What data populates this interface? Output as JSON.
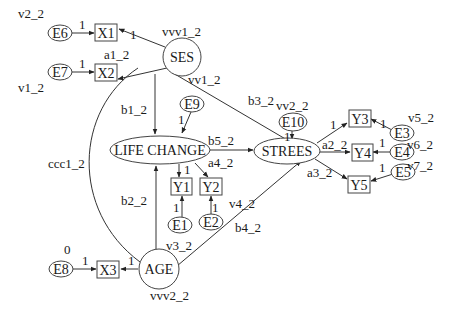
{
  "diagram": {
    "type": "structural-equation-model",
    "nodes": {
      "ses": {
        "label": "SES",
        "shape": "circle"
      },
      "age": {
        "label": "AGE",
        "shape": "circle"
      },
      "life_change": {
        "label": "LIFE CHANGE",
        "shape": "ellipse"
      },
      "strees": {
        "label": "STREES",
        "shape": "ellipse"
      },
      "x1": {
        "label": "X1",
        "shape": "rect"
      },
      "x2": {
        "label": "X2",
        "shape": "rect"
      },
      "x3": {
        "label": "X3",
        "shape": "rect"
      },
      "y1": {
        "label": "Y1",
        "shape": "rect"
      },
      "y2": {
        "label": "Y2",
        "shape": "rect"
      },
      "y3": {
        "label": "Y3",
        "shape": "rect"
      },
      "y4": {
        "label": "Y4",
        "shape": "rect"
      },
      "y5": {
        "label": "Y5",
        "shape": "rect"
      },
      "e1": {
        "label": "E1",
        "shape": "ellipse"
      },
      "e2": {
        "label": "E2",
        "shape": "ellipse"
      },
      "e3": {
        "label": "E3",
        "shape": "ellipse"
      },
      "e4": {
        "label": "E4",
        "shape": "ellipse"
      },
      "e5": {
        "label": "E5",
        "shape": "ellipse"
      },
      "e6": {
        "label": "E6",
        "shape": "ellipse"
      },
      "e7": {
        "label": "E7",
        "shape": "ellipse"
      },
      "e8": {
        "label": "E8",
        "shape": "ellipse"
      },
      "e9": {
        "label": "E9",
        "shape": "ellipse"
      },
      "e10": {
        "label": "E10",
        "shape": "ellipse"
      }
    },
    "variance_labels": {
      "e6": "v2_2",
      "e7": "v1_2",
      "e8": "0",
      "ses": "vvv1_2",
      "age": "vvv2_2",
      "e10": "vv2_2",
      "e3": "v5_2",
      "e4": "v6_2",
      "e5": "v7_2",
      "e9": "vv1_2",
      "e1": "v3_2",
      "e2": "v4_2"
    },
    "path_labels": {
      "e6_x1": "1",
      "e7_x2": "1",
      "ses_x1": "1",
      "ses_x2": "a1_2",
      "ses_life": "b1_2",
      "ses_strees": "b3_2",
      "ses_age_cov": "ccc1_2",
      "e9_life": "1",
      "life_strees": "b5_2",
      "life_y1": "1",
      "life_y2": "a4_2",
      "e1_y1": "1",
      "e2_y2": "1",
      "age_life": "b2_2",
      "age_strees": "b4_2",
      "age_x3": "1",
      "e8_x3": "1",
      "e10_strees": "1",
      "strees_y3": "1",
      "strees_y4": "a2_2",
      "strees_y5": "a3_2",
      "e3_y3": "1",
      "e4_y4": "1",
      "e5_y5": "1"
    }
  }
}
